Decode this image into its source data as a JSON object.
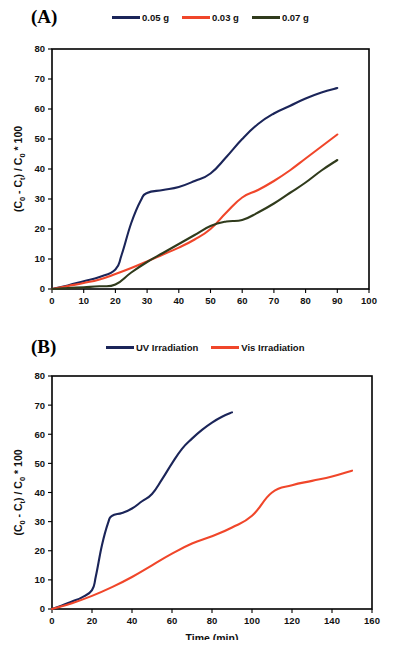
{
  "figure": {
    "background": "#ffffff",
    "colors": {
      "navy": "#1b2559",
      "red": "#f0462a",
      "olive": "#303b1c",
      "axis": "#000000"
    }
  },
  "panels": [
    {
      "label": "(A)",
      "legend_position": "top",
      "legend": [
        {
          "label": "0.05 g",
          "color": "#1b2559"
        },
        {
          "label": "0.03 g",
          "color": "#f0462a"
        },
        {
          "label": "0.07 g",
          "color": "#303b1c"
        }
      ]
    },
    {
      "label": "(B)",
      "legend_position": "top",
      "legend": [
        {
          "label": "UV Irradiation",
          "color": "#1b2559"
        },
        {
          "label": "Vis Irradiation",
          "color": "#f0462a"
        }
      ]
    }
  ],
  "chart_data": [
    {
      "type": "line",
      "title": "(A)",
      "xlabel": "Time (min)",
      "ylabel": "(C₀ - Cₜ) / C₀ * 100",
      "xlim": [
        0,
        100
      ],
      "ylim": [
        0,
        80
      ],
      "xticks": [
        0,
        10,
        20,
        30,
        40,
        50,
        60,
        70,
        80,
        90,
        100
      ],
      "yticks": [
        0,
        10,
        20,
        30,
        40,
        50,
        60,
        70,
        80
      ],
      "grid": false,
      "legend_position": "top",
      "series": [
        {
          "name": "0.05 g",
          "color": "#1b2559",
          "x": [
            0,
            5,
            10,
            15,
            20,
            22,
            25,
            28,
            30,
            35,
            40,
            45,
            50,
            55,
            60,
            65,
            70,
            75,
            80,
            85,
            90
          ],
          "values": [
            0,
            1.2,
            2.6,
            4.0,
            6.5,
            11.5,
            22.0,
            29.5,
            32.0,
            33.0,
            34.0,
            36.0,
            38.5,
            44.0,
            50.0,
            55.0,
            58.5,
            61.0,
            63.5,
            65.5,
            67.0
          ]
        },
        {
          "name": "0.03 g",
          "color": "#f0462a",
          "x": [
            0,
            5,
            10,
            15,
            20,
            25,
            30,
            35,
            40,
            45,
            50,
            55,
            60,
            65,
            70,
            75,
            80,
            85,
            90
          ],
          "values": [
            0,
            1.0,
            2.0,
            3.2,
            5.0,
            7.0,
            9.2,
            11.5,
            13.8,
            16.5,
            20.0,
            25.5,
            30.5,
            33.0,
            36.0,
            39.5,
            43.5,
            47.5,
            51.5
          ]
        },
        {
          "name": "0.07 g",
          "color": "#303b1c",
          "x": [
            0,
            5,
            10,
            15,
            20,
            25,
            30,
            35,
            40,
            45,
            50,
            55,
            60,
            65,
            70,
            75,
            80,
            85,
            90
          ],
          "values": [
            0,
            0.3,
            0.6,
            0.9,
            1.5,
            5.5,
            9.0,
            12.0,
            15.0,
            18.0,
            21.0,
            22.5,
            23.0,
            25.5,
            28.5,
            32.0,
            35.5,
            39.5,
            43.0
          ]
        }
      ]
    },
    {
      "type": "line",
      "title": "(B)",
      "xlabel": "Time (min)",
      "ylabel": "(C₀ - Cₜ) / C₀ * 100",
      "xlim": [
        0,
        160
      ],
      "ylim": [
        0,
        80
      ],
      "xticks": [
        0,
        20,
        40,
        60,
        80,
        100,
        120,
        140,
        160
      ],
      "yticks": [
        0,
        10,
        20,
        30,
        40,
        50,
        60,
        70,
        80
      ],
      "grid": false,
      "legend_position": "top",
      "series": [
        {
          "name": "UV Irradiation",
          "color": "#1b2559",
          "x": [
            0,
            5,
            10,
            15,
            20,
            22,
            25,
            28,
            30,
            35,
            40,
            45,
            50,
            55,
            60,
            65,
            70,
            75,
            80,
            85,
            90
          ],
          "values": [
            0,
            1.2,
            2.6,
            4.0,
            6.5,
            11.5,
            22.0,
            29.5,
            32.0,
            33.0,
            34.5,
            37.0,
            39.5,
            44.5,
            50.0,
            55.0,
            58.5,
            61.5,
            64.0,
            66.0,
            67.5
          ]
        },
        {
          "name": "Vis Irradiation",
          "color": "#f0462a",
          "x": [
            0,
            10,
            20,
            30,
            40,
            50,
            60,
            70,
            80,
            90,
            100,
            110,
            120,
            130,
            140,
            150
          ],
          "values": [
            0,
            2.0,
            4.5,
            7.5,
            11.0,
            15.0,
            19.0,
            22.5,
            25.0,
            28.0,
            32.0,
            40.0,
            42.5,
            44.0,
            45.5,
            47.5
          ]
        }
      ]
    }
  ]
}
